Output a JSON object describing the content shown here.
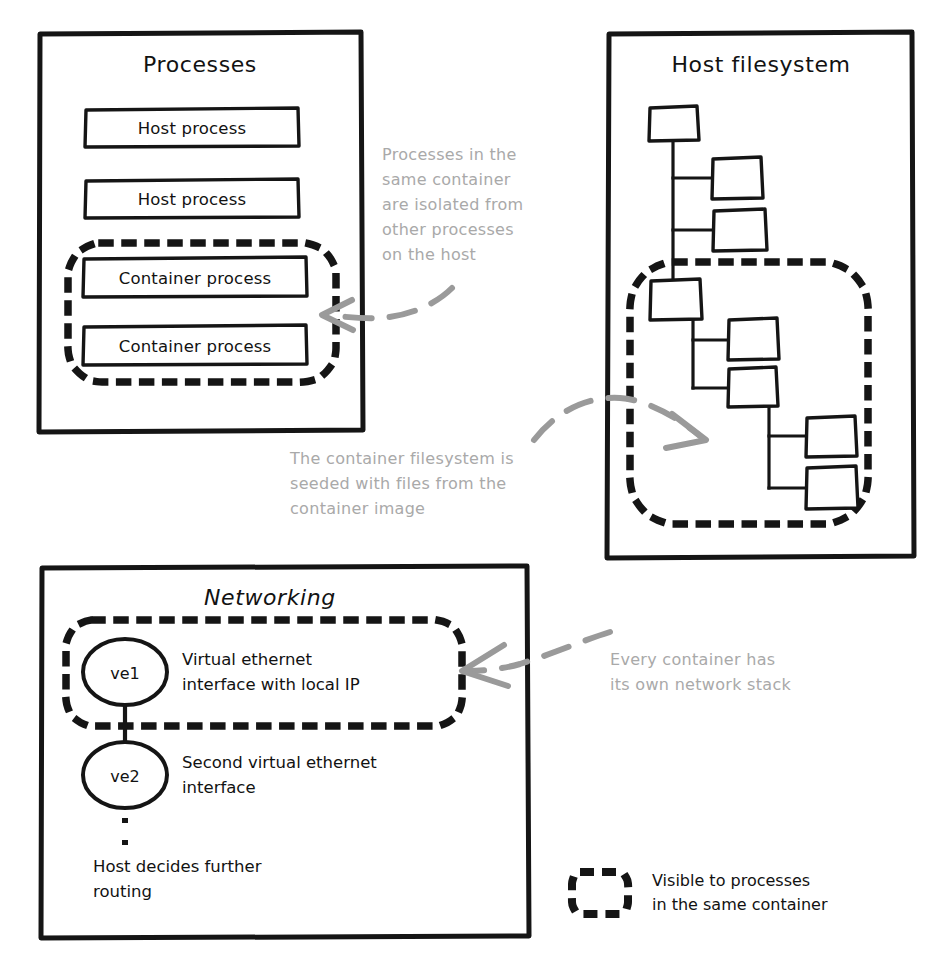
{
  "diagram": {
    "title_sr": "Container isolation: processes, host filesystem and networking",
    "colors": {
      "ink": "#121212",
      "annotation": "#a9a9a9",
      "arrow": "#9a9a9a",
      "background": "#ffffff"
    },
    "panels": [
      {
        "id": "processes",
        "title": "Processes",
        "items": [
          {
            "label": "Host process",
            "scope": "host"
          },
          {
            "label": "Host process",
            "scope": "host"
          },
          {
            "label": "Container process",
            "scope": "container"
          },
          {
            "label": "Container process",
            "scope": "container"
          }
        ]
      },
      {
        "id": "host-filesystem",
        "title": "Host filesystem",
        "nodes": [
          {
            "id": "n1",
            "scope": "host"
          },
          {
            "id": "n2",
            "scope": "host"
          },
          {
            "id": "n3",
            "scope": "host"
          },
          {
            "id": "n4",
            "scope": "container"
          },
          {
            "id": "n5",
            "scope": "container"
          },
          {
            "id": "n6",
            "scope": "container"
          },
          {
            "id": "n7",
            "scope": "container"
          },
          {
            "id": "n8",
            "scope": "container"
          }
        ]
      },
      {
        "id": "networking",
        "title": "Networking",
        "nodes": [
          {
            "id": "ve1",
            "label": "ve1",
            "note": "Virtual ethernet interface with local IP",
            "note_lines": [
              "Virtual ethernet",
              "interface with local IP"
            ],
            "scope": "container"
          },
          {
            "id": "ve2",
            "label": "ve2",
            "note": "Second virtual ethernet interface",
            "note_lines": [
              "Second virtual ethernet",
              "interface"
            ],
            "scope": "host"
          }
        ],
        "footnote": "Host decides further routing",
        "footnote_lines": [
          "Host decides further",
          "routing"
        ]
      }
    ],
    "annotations": [
      {
        "id": "processes-note",
        "text": "Processes in the same container are isolated from other processes on the host",
        "lines": [
          "Processes in the",
          "same container",
          "are isolated from",
          "other processes",
          "on the host"
        ],
        "points_to": "processes"
      },
      {
        "id": "filesystem-note",
        "text": "The container filesystem is seeded with files from the container image",
        "lines": [
          "The container filesystem is",
          "seeded with files from the",
          "container image"
        ],
        "points_to": "host-filesystem"
      },
      {
        "id": "networking-note",
        "text": "Every container has its own network stack",
        "lines": [
          "Every container has",
          "its own network stack"
        ],
        "points_to": "networking"
      }
    ],
    "legend": {
      "swatch": "dotted-rounded-rectangle",
      "label": "Visible to processes in the same container",
      "lines": [
        "Visible to processes",
        "in the same container"
      ]
    }
  }
}
